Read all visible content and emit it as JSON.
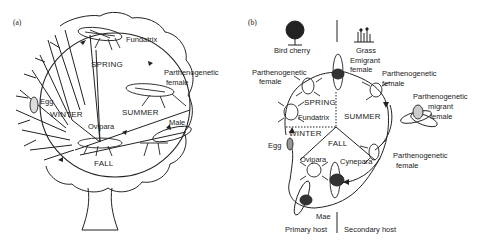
{
  "panel_a": {
    "tag": "(a)",
    "seasons": {
      "spring": "SPRING",
      "summer": "SUMMER",
      "fall": "FALL",
      "winter": "WINTER"
    },
    "labels": {
      "fundatrix": "Fundatrix",
      "parthenogenetic_female_1": "Parthenogenetic",
      "parthenogenetic_female_2": "female",
      "male": "Male",
      "ovipara": "Ovipara",
      "egg": "Egg"
    }
  },
  "panel_b": {
    "tag": "(b)",
    "hosts": {
      "top_left": "Bird cherry",
      "top_right": "Grass",
      "bottom_left": "Primary host",
      "bottom_right": "Secondary host"
    },
    "seasons": {
      "spring": "SPRING",
      "summer": "SUMMER",
      "fall": "FALL",
      "winter": "WINTER"
    },
    "labels": {
      "emigrant_1": "Emigrant",
      "emigrant_2": "female",
      "parth_left_1": "Parthenogenetic",
      "parth_left_2": "female",
      "parth_right_1": "Parthenogenetic",
      "parth_right_2": "female",
      "parth_migrant_1": "Parthenogenetic",
      "parth_migrant_2": "migrant",
      "parth_migrant_3": "female",
      "parth_low_1": "Parthenogenetic",
      "parth_low_2": "female",
      "fundatrix": "Fundatrix",
      "egg": "Egg",
      "ovipara": "Ovipara",
      "cynepara": "Cynepara",
      "male": "Mae"
    }
  }
}
